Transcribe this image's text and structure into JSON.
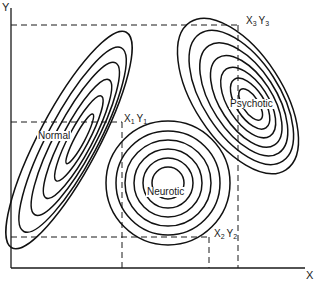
{
  "diagram": {
    "axes": {
      "x_label": "X",
      "y_label": "Y"
    },
    "clusters": [
      {
        "id": "normal",
        "label": "Normal",
        "shape": "elongated ellipse tilted up-right",
        "contours": 6
      },
      {
        "id": "neurotic",
        "label": "Neurotic",
        "shape": "concentric circles",
        "contours": 6
      },
      {
        "id": "psychotic",
        "label": "Psychotic",
        "shape": "ellipse tilted down-right",
        "contours": 7
      }
    ],
    "points": [
      {
        "id": "p1",
        "x": "X",
        "x_sub": "1",
        "y": "Y",
        "y_sub": "1"
      },
      {
        "id": "p2",
        "x": "X",
        "x_sub": "2",
        "y": "Y",
        "y_sub": "2"
      },
      {
        "id": "p3",
        "x": "X",
        "x_sub": "3",
        "y": "Y",
        "y_sub": "3"
      }
    ],
    "colors": {
      "ink": "#111111",
      "background": "#ffffff"
    }
  }
}
